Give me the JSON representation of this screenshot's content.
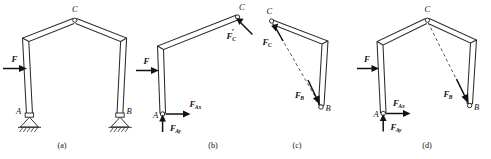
{
  "figure": {
    "background_color": "#ffffff",
    "line_color": "#2b2b2b",
    "force_color": "#111111",
    "panels": [
      {
        "id": "a",
        "caption": "(a)",
        "description": "Complete three-hinged frame ABC with pin supports at A and B and a pin at apex C, loaded by horizontal force F on the left column",
        "points": [
          {
            "name": "A",
            "label": "A"
          },
          {
            "name": "B",
            "label": "B"
          },
          {
            "name": "C",
            "label": "C"
          }
        ],
        "forces": [
          {
            "name": "F",
            "symbol": "F",
            "subscript": "",
            "prime": false,
            "direction": "right"
          }
        ],
        "supports": [
          {
            "at": "A",
            "type": "pin-support-hatched"
          },
          {
            "at": "B",
            "type": "pin-support-hatched"
          }
        ]
      },
      {
        "id": "b",
        "caption": "(b)",
        "description": "Free-body diagram of member AC showing applied load F, pin reactions at A, and the force from member BC at C",
        "points": [
          {
            "name": "A",
            "label": "A"
          },
          {
            "name": "C",
            "label": "C"
          }
        ],
        "forces": [
          {
            "name": "F",
            "symbol": "F",
            "subscript": "",
            "prime": false,
            "direction": "right"
          },
          {
            "name": "F-Ax",
            "symbol": "F",
            "subscript": "Ax",
            "prime": false,
            "direction": "right"
          },
          {
            "name": "F-Ay",
            "symbol": "F",
            "subscript": "Ay",
            "prime": false,
            "direction": "up"
          },
          {
            "name": "F-C-prime",
            "symbol": "F",
            "subscript": "C",
            "prime": true,
            "direction": "up-left"
          }
        ]
      },
      {
        "id": "c",
        "caption": "(c)",
        "description": "Free-body diagram of two-force member BC showing equal and opposite forces along line CB",
        "points": [
          {
            "name": "B",
            "label": "B"
          },
          {
            "name": "C",
            "label": "C"
          }
        ],
        "forces": [
          {
            "name": "F-C",
            "symbol": "F",
            "subscript": "C",
            "prime": false,
            "direction": "up-left"
          },
          {
            "name": "F-B",
            "symbol": "F",
            "subscript": "B",
            "prime": false,
            "direction": "down-right"
          }
        ],
        "line_of_action": {
          "style": "dashed",
          "from": "C",
          "to": "B"
        }
      },
      {
        "id": "d",
        "caption": "(d)",
        "description": "Free-body diagram of the entire frame showing applied load F, reactions at A, and the resultant reaction at B along line CB",
        "points": [
          {
            "name": "A",
            "label": "A"
          },
          {
            "name": "B",
            "label": "B"
          },
          {
            "name": "C",
            "label": "C"
          }
        ],
        "forces": [
          {
            "name": "F",
            "symbol": "F",
            "subscript": "",
            "prime": false,
            "direction": "right"
          },
          {
            "name": "F-Ax",
            "symbol": "F",
            "subscript": "Ax",
            "prime": false,
            "direction": "right"
          },
          {
            "name": "F-Ay",
            "symbol": "F",
            "subscript": "Ay",
            "prime": false,
            "direction": "up"
          },
          {
            "name": "F-B",
            "symbol": "F",
            "subscript": "B",
            "prime": false,
            "direction": "down-right"
          }
        ],
        "line_of_action": {
          "style": "dashed",
          "from": "C",
          "to": "B"
        }
      }
    ]
  },
  "labels": {
    "F": "F",
    "C": "C",
    "A": "A",
    "B": "B",
    "sub_Ax": "Ax",
    "sub_Ay": "Ay",
    "sub_B": "B",
    "sub_C": "C",
    "prime": "′",
    "caption_a": "(a)",
    "caption_b": "(b)",
    "caption_c": "(c)",
    "caption_d": "(d)"
  }
}
